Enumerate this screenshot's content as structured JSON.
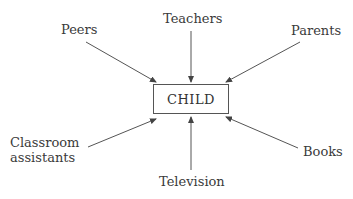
{
  "diagram": {
    "center": "CHILD",
    "nodes": {
      "peers": "Peers",
      "teachers": "Teachers",
      "parents": "Parents",
      "classroom_line1": "Classroom",
      "classroom_line2": "assistants",
      "television": "Television",
      "books": "Books"
    },
    "edges": [
      {
        "from": "Peers",
        "to": "CHILD"
      },
      {
        "from": "Teachers",
        "to": "CHILD"
      },
      {
        "from": "Parents",
        "to": "CHILD"
      },
      {
        "from": "Classroom assistants",
        "to": "CHILD"
      },
      {
        "from": "Television",
        "to": "CHILD"
      },
      {
        "from": "Books",
        "to": "CHILD"
      }
    ]
  }
}
